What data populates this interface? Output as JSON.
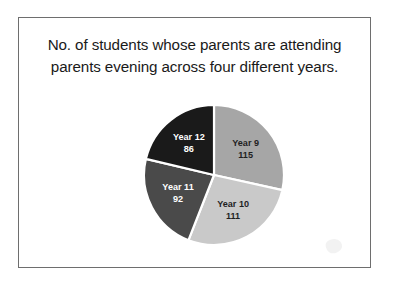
{
  "figure": {
    "title_lines": [
      "No. of students whose parents are attending",
      "parents evening across four different years."
    ],
    "title_full": "No. of students whose parents are attending parents evening across four different years."
  },
  "chart_data": {
    "type": "pie",
    "title": "No. of students whose parents are attending parents evening across four different years.",
    "xlabel": "",
    "ylabel": "",
    "legend": "none",
    "grid": false,
    "total": 404,
    "start_angle_deg": 0,
    "direction": "clockwise",
    "categories": [
      "Year 9",
      "Year 10",
      "Year 11",
      "Year 12"
    ],
    "values": [
      115,
      111,
      92,
      86
    ],
    "colors": [
      "#a6a6a6",
      "#c9c9c9",
      "#4a4a4a",
      "#1a1a1a"
    ],
    "label_colors": [
      "#1f1f1f",
      "#1f1f1f",
      "#ffffff",
      "#ffffff"
    ],
    "slices": [
      {
        "name": "Year 9",
        "value": 115,
        "value_text": "115",
        "label": "Year 9",
        "color": "#a6a6a6",
        "label_color": "#1f1f1f",
        "angle_deg": 102.5,
        "start_deg": 0,
        "end_deg": 102.5,
        "percent": 28.5
      },
      {
        "name": "Year 10",
        "value": 111,
        "value_text": "111",
        "label": "Year 10",
        "color": "#c9c9c9",
        "label_color": "#1f1f1f",
        "angle_deg": 98.9,
        "start_deg": 102.5,
        "end_deg": 201.4,
        "percent": 27.5
      },
      {
        "name": "Year 11",
        "value": 92,
        "value_text": "92",
        "label": "Year 11",
        "color": "#4a4a4a",
        "label_color": "#ffffff",
        "angle_deg": 82.0,
        "start_deg": 201.4,
        "end_deg": 283.4,
        "percent": 22.8
      },
      {
        "name": "Year 12",
        "value": 86,
        "value_text": "86",
        "label": "Year 12",
        "color": "#1a1a1a",
        "label_color": "#ffffff",
        "angle_deg": 76.6,
        "start_deg": 283.4,
        "end_deg": 360,
        "percent": 21.3
      }
    ]
  },
  "style": {
    "border_color": "#6e6e6e",
    "background": "#ffffff",
    "text_color": "#1a1a1a"
  }
}
